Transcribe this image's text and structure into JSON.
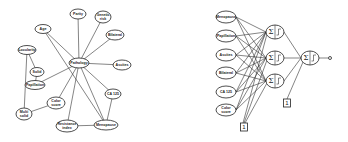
{
  "left_graph": {
    "title": "",
    "center_node": "Pathology",
    "nodes": [
      {
        "id": "parity",
        "label": "Parity",
        "x": 78,
        "y": 14,
        "rx": 8,
        "ry": 5
      },
      {
        "id": "genetic",
        "label": "Genetic risk",
        "lines": [
          "Genetic",
          "risk"
        ],
        "x": 103,
        "y": 17,
        "rx": 8,
        "ry": 6
      },
      {
        "id": "age",
        "label": "Age",
        "x": 43,
        "y": 29,
        "rx": 8,
        "ry": 4.5
      },
      {
        "id": "bilateral",
        "label": "Bilateral",
        "x": 115,
        "y": 35,
        "rx": 9,
        "ry": 5
      },
      {
        "id": "locularity",
        "label": "Locularity",
        "x": 27,
        "y": 50,
        "rx": 9,
        "ry": 4.5
      },
      {
        "id": "pathology",
        "label": "Pathology",
        "x": 79,
        "y": 63,
        "rx": 10,
        "ry": 5
      },
      {
        "id": "ascites",
        "label": "Ascites",
        "x": 122,
        "y": 65,
        "rx": 9,
        "ry": 5
      },
      {
        "id": "solid",
        "label": "Solid",
        "x": 37,
        "y": 72,
        "rx": 7,
        "ry": 4.5
      },
      {
        "id": "papillation",
        "label": "Papillation",
        "x": 35,
        "y": 85,
        "rx": 10,
        "ry": 4.5
      },
      {
        "id": "ca125",
        "label": "CA 125",
        "x": 113,
        "y": 94,
        "rx": 8,
        "ry": 5
      },
      {
        "id": "color",
        "label": "Color score",
        "lines": [
          "Color",
          "score"
        ],
        "x": 56,
        "y": 103,
        "rx": 9,
        "ry": 6
      },
      {
        "id": "multisolid",
        "label": "Multi solid",
        "lines": [
          "Multi",
          "solid"
        ],
        "x": 24,
        "y": 114,
        "rx": 8,
        "ry": 6
      },
      {
        "id": "menopause",
        "label": "Menopause",
        "x": 106,
        "y": 125,
        "rx": 12,
        "ry": 5
      },
      {
        "id": "resistance",
        "label": "Resistance index",
        "lines": [
          "Resistance",
          "index"
        ],
        "x": 67,
        "y": 126,
        "rx": 11,
        "ry": 6
      }
    ],
    "edges": [
      [
        "pathology",
        "parity"
      ],
      [
        "pathology",
        "genetic"
      ],
      [
        "pathology",
        "age"
      ],
      [
        "pathology",
        "bilateral"
      ],
      [
        "pathology",
        "ascites"
      ],
      [
        "pathology",
        "papillation"
      ],
      [
        "pathology",
        "ca125"
      ],
      [
        "pathology",
        "color"
      ],
      [
        "pathology",
        "menopause"
      ],
      [
        "pathology",
        "resistance"
      ],
      [
        "locularity",
        "solid"
      ],
      [
        "solid",
        "papillation"
      ],
      [
        "locularity",
        "multisolid"
      ],
      [
        "color",
        "multisolid"
      ],
      [
        "age",
        "menopause"
      ],
      [
        "ca125",
        "menopause"
      ],
      [
        "resistance",
        "menopause"
      ]
    ]
  },
  "right_network": {
    "inputs": [
      {
        "label": "Menopause",
        "x": 226,
        "y": 17
      },
      {
        "label": "Papillation",
        "x": 226,
        "y": 36
      },
      {
        "label": "Ascites",
        "x": 226,
        "y": 55
      },
      {
        "label": "Bilateral",
        "x": 226,
        "y": 73
      },
      {
        "label": "CA 125",
        "x": 226,
        "y": 92
      },
      {
        "label": "Color score",
        "lines": [
          "Color",
          "score"
        ],
        "x": 226,
        "y": 110
      }
    ],
    "hidden": [
      {
        "x": 275,
        "y": 32
      },
      {
        "x": 275,
        "y": 58
      },
      {
        "x": 275,
        "y": 81
      }
    ],
    "output": {
      "x": 310,
      "y": 58
    },
    "output_terminal": {
      "x": 330,
      "y": 58
    },
    "sum_symbol": "Σ",
    "bias_nodes": [
      {
        "label": "1",
        "x": 244,
        "y": 127,
        "targets": "hidden"
      },
      {
        "label": "1",
        "x": 287,
        "y": 103,
        "targets": "output"
      }
    ]
  }
}
